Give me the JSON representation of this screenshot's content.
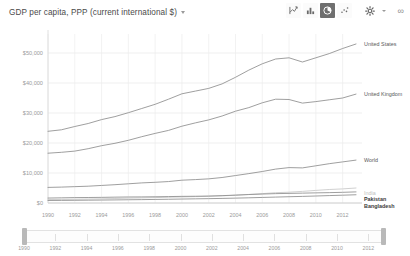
{
  "header": {
    "title": "GDP per capita, PPP (current international $)",
    "dropdown_icon": "chevron-down-icon",
    "toolbar": {
      "chart_type_buttons": [
        {
          "name": "line-chart-icon",
          "label": "Line chart",
          "selected": false
        },
        {
          "name": "bar-chart-icon",
          "label": "Bar chart",
          "selected": false
        },
        {
          "name": "pie-chart-icon",
          "label": "Pie chart",
          "selected": true
        },
        {
          "name": "scatter-chart-icon",
          "label": "Scatter chart",
          "selected": false
        }
      ],
      "settings_label": "Settings",
      "settings_icon": "gear-icon",
      "settings_caret_icon": "chevron-down-icon",
      "more_icon": "more-options-icon",
      "more_label": "∞"
    }
  },
  "chart_data": {
    "type": "line",
    "title": "GDP per capita, PPP (current international $)",
    "xlabel": "",
    "ylabel": "",
    "grid": true,
    "legend_position": "right-inline",
    "xlim": [
      1990,
      2013
    ],
    "ylim": [
      0,
      55000
    ],
    "x_ticks": [
      "1990",
      "1992",
      "1994",
      "1996",
      "1998",
      "2000",
      "2002",
      "2004",
      "2006",
      "2008",
      "2010",
      "2012"
    ],
    "y_ticks": [
      "$0",
      "$10,000",
      "$20,000",
      "$30,000",
      "$40,000",
      "$50,000"
    ],
    "y_tick_values": [
      0,
      10000,
      20000,
      30000,
      40000,
      50000
    ],
    "x": [
      1990,
      1991,
      1992,
      1993,
      1994,
      1995,
      1996,
      1997,
      1998,
      1999,
      2000,
      2001,
      2002,
      2003,
      2004,
      2005,
      2006,
      2007,
      2008,
      2009,
      2010,
      2011,
      2012,
      2013
    ],
    "series": [
      {
        "name": "United States",
        "color": "#8e8e8e",
        "label_style": "normal",
        "values": [
          23900,
          24400,
          25500,
          26500,
          27800,
          28800,
          30100,
          31500,
          32900,
          34600,
          36400,
          37300,
          38200,
          39700,
          41900,
          44300,
          46400,
          48000,
          48400,
          47000,
          48400,
          49800,
          51500,
          53000
        ]
      },
      {
        "name": "United Kingdom",
        "color": "#8e8e8e",
        "label_style": "normal",
        "values": [
          16600,
          16900,
          17300,
          18100,
          19100,
          19900,
          20900,
          22100,
          23200,
          24200,
          25600,
          26700,
          27700,
          29000,
          30600,
          31800,
          33400,
          34600,
          34500,
          33300,
          33800,
          34400,
          35000,
          36300
        ]
      },
      {
        "name": "World",
        "color": "#8e8e8e",
        "label_style": "normal",
        "values": [
          5200,
          5300,
          5450,
          5600,
          5850,
          6100,
          6400,
          6700,
          6900,
          7150,
          7600,
          7800,
          8050,
          8500,
          9150,
          9800,
          10500,
          11300,
          11800,
          11700,
          12400,
          13100,
          13700,
          14300
        ]
      },
      {
        "name": "India",
        "color": "#c8c8c8",
        "label_style": "faint",
        "values": [
          1150,
          1200,
          1250,
          1320,
          1400,
          1500,
          1610,
          1690,
          1800,
          1930,
          2020,
          2130,
          2210,
          2390,
          2600,
          2850,
          3130,
          3430,
          3600,
          3870,
          4200,
          4500,
          4700,
          5000
        ]
      },
      {
        "name": "Pakistan",
        "color": "#8e8e8e",
        "label_style": "strong",
        "values": [
          1650,
          1720,
          1800,
          1830,
          1880,
          1950,
          2010,
          2030,
          2080,
          2140,
          2210,
          2250,
          2320,
          2450,
          2620,
          2820,
          2980,
          3120,
          3200,
          3290,
          3380,
          3450,
          3560,
          3700
        ]
      },
      {
        "name": "Bangladesh",
        "color": "#8e8e8e",
        "label_style": "strong",
        "values": [
          830,
          860,
          900,
          940,
          980,
          1030,
          1080,
          1130,
          1190,
          1250,
          1320,
          1390,
          1450,
          1530,
          1620,
          1730,
          1850,
          1970,
          2090,
          2200,
          2330,
          2470,
          2600,
          2750
        ]
      }
    ]
  },
  "range_slider": {
    "start_label": "1990",
    "end_label": "2012",
    "left_handle": "range-slider-left-handle",
    "right_handle": "range-slider-right-handle",
    "ticks": [
      "1990",
      "1992",
      "1994",
      "1996",
      "1998",
      "2000",
      "2002",
      "2004",
      "2006",
      "2008",
      "2010",
      "2012"
    ]
  }
}
